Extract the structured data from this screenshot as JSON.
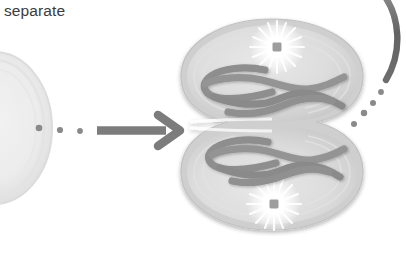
{
  "figure": {
    "kind": "biology-diagram",
    "background_color": "#ffffff",
    "width": 406,
    "height": 258
  },
  "labels": {
    "separate": "separate"
  },
  "colors": {
    "text": "#3b3b3b",
    "arrow": "#7c7c7c",
    "dot": "#8a8a8a",
    "curve_arc": "#6e6e6e",
    "cell_fill_outer": "#d8d8d8",
    "cell_fill_inner": "#e2e2e2",
    "cell_rim": "#c6c6c6",
    "cell_membrane": "#cfcfcf",
    "chromosome": "#8e8e8e",
    "chromosome_edge": "#7a7a7a",
    "aster_glow": "#ffffff",
    "centriole": "#9a9a9a",
    "left_cell_fill": "#ececec",
    "left_cell_rim": "#dedede"
  },
  "elements": {
    "previous_cell": {
      "name": "previous-stage-cell",
      "description": "partially visible round cell at left edge",
      "center_x": -4,
      "center_y": 128,
      "radius_x": 56,
      "radius_y": 74
    },
    "transition_dots": {
      "name": "transition-dots-left",
      "count": 3,
      "points": [
        {
          "x": 39,
          "y": 128,
          "r": 3.2
        },
        {
          "x": 60,
          "y": 130,
          "r": 3.0
        },
        {
          "x": 80,
          "y": 131,
          "r": 2.8
        }
      ]
    },
    "arrow": {
      "name": "process-arrow",
      "direction": "right",
      "x1": 96,
      "y1": 130,
      "x2": 178,
      "y2": 130,
      "thickness": 8,
      "head_size": 16
    },
    "dividing_cell": {
      "name": "dividing-cell",
      "stage": "cytokinesis",
      "center_x": 272,
      "center_y": 125,
      "lobe_radius_x": 91,
      "lobe_radius_y": 58,
      "top_lobe_center_y": 75,
      "bottom_lobe_center_y": 175,
      "furrow_y": 125
    },
    "asters": [
      {
        "name": "aster-top",
        "x": 277,
        "y": 47,
        "radius": 26,
        "spikes": 18
      },
      {
        "name": "aster-bottom",
        "x": 274,
        "y": 204,
        "radius": 26,
        "spikes": 18
      }
    ],
    "chromosomes": {
      "top_group_count": 3,
      "bottom_group_count": 3,
      "stroke_width": 7
    },
    "transition_dots_right": {
      "name": "transition-dots-right",
      "count": 4,
      "points": [
        {
          "x": 354,
          "y": 120,
          "r": 3.0
        },
        {
          "x": 365,
          "y": 110,
          "r": 3.2
        },
        {
          "x": 374,
          "y": 99,
          "r": 3.0
        },
        {
          "x": 381,
          "y": 90,
          "r": 2.8
        }
      ]
    },
    "next_arc": {
      "name": "next-stage-arc",
      "description": "dark curved stroke sweeping from top edge down to right",
      "stroke_width": 6
    }
  }
}
